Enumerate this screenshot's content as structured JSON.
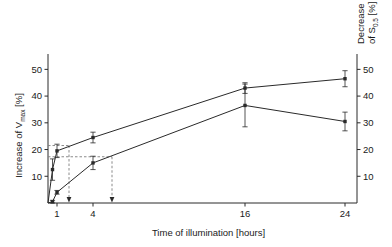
{
  "chart_data": {
    "type": "line",
    "title": "",
    "xlabel": "Time of illumination [hours]",
    "ylabel": "Increase of V",
    "ylabel_sub": "max",
    "ylabel_unit": "[%]",
    "ylabel_right_line1": "Decrease",
    "ylabel_right_line2": "of S",
    "ylabel_right_sub": "0.5",
    "ylabel_right_unit": "[%]",
    "x": [
      0,
      0.5,
      1,
      4,
      16,
      24
    ],
    "x_tick_labels": [
      "1",
      "4",
      "16",
      "24"
    ],
    "x_tick_values": [
      1,
      4,
      16,
      24
    ],
    "y_tick_labels": [
      "10",
      "20",
      "30",
      "40",
      "50"
    ],
    "y_tick_values": [
      10,
      20,
      30,
      40,
      50
    ],
    "ylim": [
      0,
      55
    ],
    "y_right_tick_labels": [
      "10",
      "20",
      "30",
      "40",
      "50"
    ],
    "y_right_tick_values": [
      10,
      20,
      30,
      40,
      50
    ],
    "grid": false,
    "legend": "none",
    "series": [
      {
        "name": "Increase of Vmax",
        "axis": "left",
        "marker": "square",
        "values": [
          0,
          12.5,
          19.5,
          24.5,
          43.0,
          46.5
        ],
        "errors": [
          0,
          4.0,
          2.5,
          2.0,
          2.0,
          3.0
        ]
      },
      {
        "name": "Decrease of S0.5",
        "axis": "right",
        "marker": "square",
        "values": [
          0,
          0.5,
          4.0,
          15.0,
          36.5,
          30.5
        ],
        "errors": [
          0,
          0.5,
          0.7,
          2.5,
          8.0,
          3.5
        ]
      }
    ],
    "annotations": [
      {
        "type": "dashed-hline",
        "y": 21.5,
        "from_x": 0,
        "to_x": 2.0
      },
      {
        "type": "dashed-hline",
        "y": 17.3,
        "from_x": 0,
        "to_x": 5.5
      },
      {
        "type": "dashed-arrow",
        "x": 2.0,
        "from_y": 21.5,
        "to_y": 0
      },
      {
        "type": "dashed-arrow",
        "x": 5.5,
        "from_y": 17.3,
        "to_y": 0
      }
    ]
  }
}
